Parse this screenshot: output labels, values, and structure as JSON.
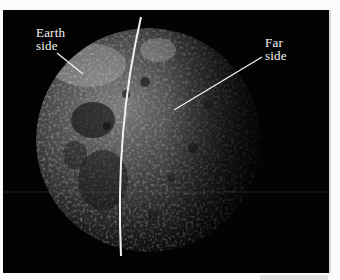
{
  "figure": {
    "labels": {
      "earth_side": [
        "Earth",
        "side"
      ],
      "far_side": [
        "Far",
        "side"
      ]
    },
    "colors": {
      "background": "#030303",
      "label_text": "#f4f4f4",
      "divider_line": "#f2f2f2",
      "page": "#fbfbfb"
    }
  }
}
